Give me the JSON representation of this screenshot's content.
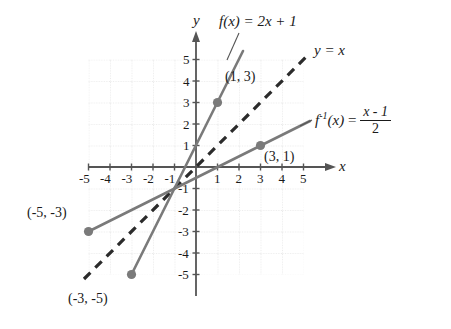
{
  "figure": {
    "kind": "coordinate-plane-graph",
    "axes": {
      "x_axis_name": "x",
      "y_axis_name": "y",
      "xlim": [
        -5,
        5
      ],
      "ylim": [
        -5,
        5
      ],
      "grid": "dotted",
      "x_ticks_negative": [
        "-5",
        "-4",
        "-3",
        "-2",
        "-1"
      ],
      "x_ticks_positive": [
        "1",
        "2",
        "3",
        "4",
        "5"
      ],
      "y_ticks_positive": [
        "5",
        "4",
        "3",
        "2",
        "1"
      ],
      "y_ticks_negative": [
        "-1",
        "-2",
        "-3",
        "-4",
        "-5"
      ]
    },
    "curves": {
      "f": {
        "label_f": "f",
        "label_paren_x": "(x)",
        "label_equals": "= 2x + 1",
        "full_text": "f(x) = 2x + 1",
        "style": "solid",
        "color": "#7a7a7a",
        "slope": 2,
        "intercept": 1,
        "endpoints": [
          [
            -3,
            -5
          ],
          [
            2.2,
            5.4
          ]
        ]
      },
      "identity": {
        "label": "y = x",
        "style": "dashed",
        "color": "#2b2b2b",
        "slope": 1,
        "intercept": 0,
        "endpoints": [
          [
            -5,
            -5
          ],
          [
            5,
            5
          ]
        ]
      },
      "f_inverse": {
        "label_f": "f",
        "label_sup": "-1",
        "label_paren_x": "(x)",
        "label_equals": "=",
        "numerator": "x - 1",
        "denominator": "2",
        "full_text": "f^-1(x) = (x - 1)/2",
        "style": "solid",
        "color": "#7a7a7a",
        "slope": 0.5,
        "intercept": -0.5,
        "endpoints": [
          [
            -5,
            -3
          ],
          [
            5.2,
            2.1
          ]
        ]
      }
    },
    "points": [
      {
        "name": "point-1-3",
        "label": "(1, 3)",
        "x": 1,
        "y": 3
      },
      {
        "name": "point-3-1",
        "label": "(3, 1)",
        "x": 3,
        "y": 1
      },
      {
        "name": "point-neg5-neg3",
        "label": "(-5, -3)",
        "x": -5,
        "y": -3
      },
      {
        "name": "point-neg3-neg5",
        "label": "(-3, -5)",
        "x": -3,
        "y": -5
      }
    ],
    "colors": {
      "line_gray": "#7a7a7a",
      "dash_black": "#2b2b2b",
      "grid": "#cfcfcf",
      "axis": "#555555",
      "text": "#1a1a1a",
      "marker": "#7a7a7a"
    }
  }
}
